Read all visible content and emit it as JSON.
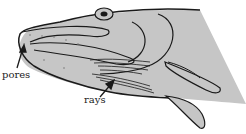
{
  "diagram": {
    "labels": {
      "pores": "pores",
      "rays": "rays"
    },
    "colors": {
      "fill": "#c6c6c6",
      "outline": "#1a1a1a",
      "background": "#ffffff"
    }
  }
}
